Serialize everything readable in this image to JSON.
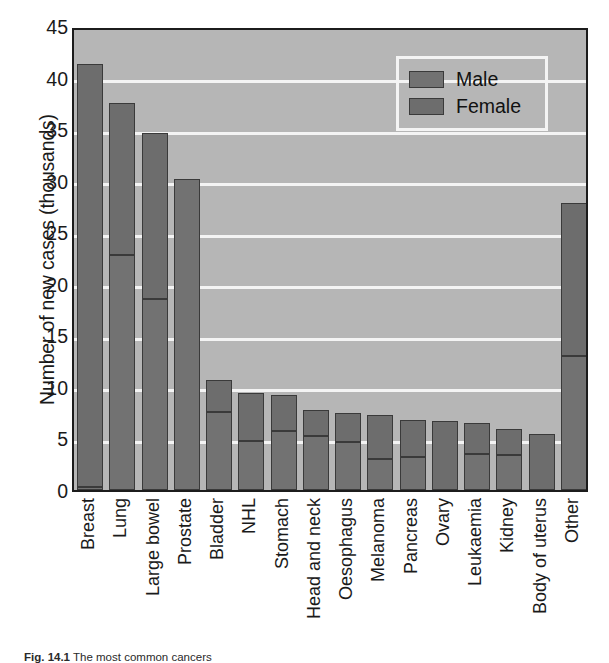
{
  "figure": {
    "caption_prefix": "Fig. 14.1",
    "caption_text": "The most common cancers"
  },
  "legend": {
    "position": "top-right",
    "entries": [
      {
        "label": "Male",
        "color": "#727272",
        "key": "male"
      },
      {
        "label": "Female",
        "color": "#6d6d6d",
        "key": "female"
      }
    ]
  },
  "chart_data": {
    "type": "bar",
    "stacked": true,
    "title": "",
    "subtitle": "",
    "xlabel": "",
    "ylabel": "Number of new cases (thousands)",
    "ylim": [
      0,
      45
    ],
    "yticks": [
      0,
      5,
      10,
      15,
      20,
      25,
      30,
      35,
      40,
      45
    ],
    "ytick_labels": [
      "0",
      "5",
      "10",
      "15",
      "20",
      "25",
      "30",
      "35",
      "40",
      "45"
    ],
    "grid": "horizontal-white",
    "plot_background": "#b6b6b6",
    "categories": [
      "Breast",
      "Lung",
      "Large bowel",
      "Prostate",
      "Bladder",
      "NHL",
      "Stomach",
      "Head and neck",
      "Oesophagus",
      "Melanoma",
      "Pancreas",
      "Ovary",
      "Leukaemia",
      "Kidney",
      "Body of uterus",
      "Other"
    ],
    "series": [
      {
        "name": "Male",
        "color": "#727272",
        "values": [
          0.3,
          22.8,
          18.5,
          30.2,
          7.6,
          4.8,
          5.7,
          5.2,
          4.7,
          3.0,
          3.2,
          0.0,
          3.5,
          3.4,
          0.0,
          13.0
        ]
      },
      {
        "name": "Female",
        "color": "#6d6d6d",
        "values": [
          41.0,
          14.7,
          16.1,
          0.0,
          3.1,
          4.6,
          3.5,
          2.6,
          2.8,
          4.3,
          3.6,
          6.7,
          3.0,
          2.5,
          5.4,
          14.8
        ]
      }
    ],
    "totals": [
      41.3,
      37.5,
      34.6,
      30.2,
      10.7,
      9.4,
      9.2,
      7.8,
      7.5,
      7.3,
      6.8,
      6.7,
      6.5,
      5.9,
      5.4,
      27.8
    ]
  }
}
